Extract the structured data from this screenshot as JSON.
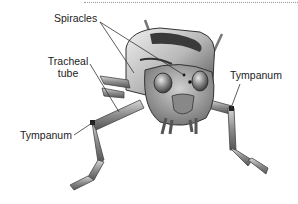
{
  "diagram": {
    "labels": [
      {
        "id": "spiracles",
        "text": "Spiracles"
      },
      {
        "id": "tracheal",
        "line1": "Tracheal",
        "line2": "tube"
      },
      {
        "id": "tympanum_left",
        "text": "Tympanum"
      },
      {
        "id": "tympanum_right",
        "text": "Tympanum"
      }
    ],
    "colors": {
      "body_light": "#d6d6d6",
      "body_mid": "#9e9e9e",
      "body_dark": "#3a3a3a",
      "leader_line": "#333333",
      "text": "#222222"
    }
  }
}
